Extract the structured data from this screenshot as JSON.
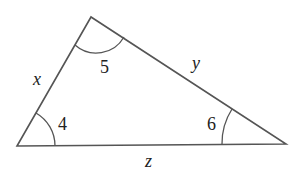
{
  "diagram": {
    "type": "triangle",
    "stroke_color": "#555555",
    "vertices": {
      "bottom_left": [
        17,
        146
      ],
      "top": [
        91,
        17
      ],
      "bottom_right": [
        286,
        144
      ]
    },
    "sides": {
      "left": "x",
      "right": "y",
      "bottom": "z"
    },
    "angles": {
      "bottom_left": "4",
      "top": "5",
      "bottom_right": "6"
    }
  }
}
